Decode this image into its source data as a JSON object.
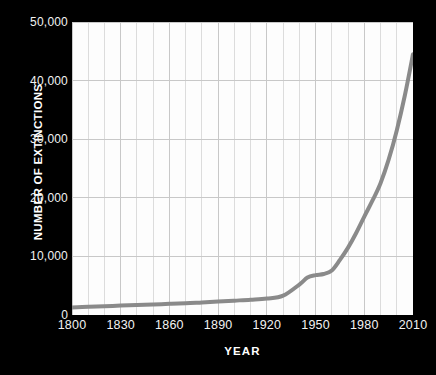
{
  "chart_data": {
    "type": "line",
    "title": "",
    "xlabel": "YEAR",
    "ylabel": "NUMBER OF EXTINCTIONS",
    "xlim": [
      1800,
      2010
    ],
    "ylim": [
      0,
      50000
    ],
    "grid": true,
    "legend": "none",
    "x_tick_labels": [
      "1800",
      "1830",
      "1860",
      "1890",
      "1920",
      "1950",
      "1980",
      "2010"
    ],
    "x_tick_values": [
      1800,
      1830,
      1860,
      1890,
      1920,
      1950,
      1980,
      2010
    ],
    "y_tick_labels": [
      "0",
      "10,000",
      "20,000",
      "30,000",
      "40,000",
      "50,000"
    ],
    "y_tick_values": [
      0,
      10000,
      20000,
      30000,
      40000,
      50000
    ],
    "x_minor_gridline_step": 10,
    "y_gridline_step": 10000,
    "series": [
      {
        "name": "Number of extinctions",
        "color": "#8a8a8a",
        "line_width": 4,
        "x": [
          1800,
          1810,
          1820,
          1830,
          1840,
          1850,
          1860,
          1870,
          1880,
          1890,
          1900,
          1910,
          1920,
          1930,
          1940,
          1945,
          1950,
          1955,
          1960,
          1965,
          1970,
          1975,
          1980,
          1985,
          1990,
          1995,
          2000,
          2005,
          2010
        ],
        "values": [
          1300,
          1400,
          1500,
          1600,
          1700,
          1800,
          1900,
          2000,
          2150,
          2300,
          2450,
          2600,
          2800,
          3300,
          5200,
          6400,
          6800,
          7000,
          7600,
          9400,
          11500,
          14000,
          16800,
          19500,
          22500,
          26500,
          31500,
          37500,
          44500
        ]
      }
    ],
    "annotations": []
  },
  "colors": {
    "page_background": "#000000",
    "plot_background": "#fdfdfd",
    "gridline": "#c8c8c8",
    "minor_gridline": "#dcdcdc",
    "axis_text": "#f2f2f2",
    "axis_title_text": "#ffffff",
    "line": "#8a8a8a"
  }
}
